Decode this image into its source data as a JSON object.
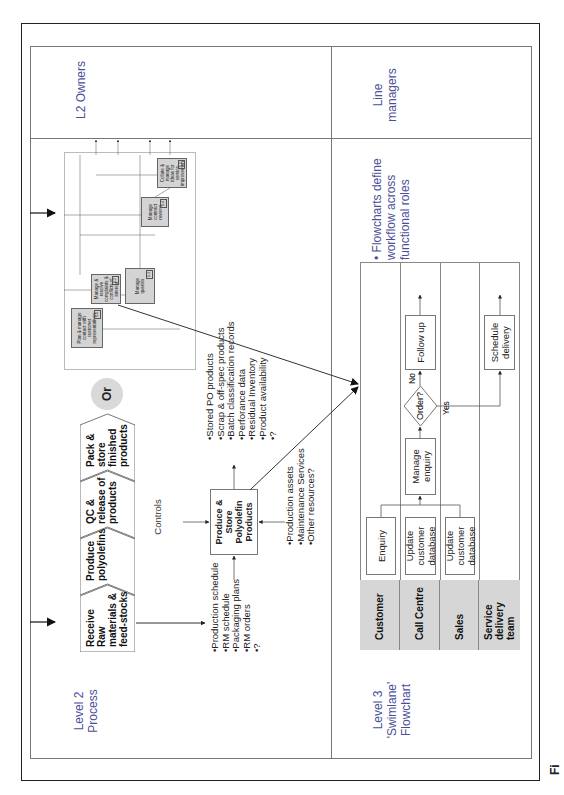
{
  "page": {
    "orientation": "rotated-90-ccw",
    "caption_fragment": "Fi"
  },
  "rows": {
    "top": {
      "left_label": "Level 2\nProcess",
      "right_label": "L2 Owners",
      "chevrons": [
        {
          "label": "Receive Raw materials & feed-stocks"
        },
        {
          "label": "Produce polyolefins"
        },
        {
          "label": "QC & release of products"
        },
        {
          "label": "Pack & store finished products"
        }
      ],
      "or_label": "Or",
      "idef": {
        "box_label": "Produce & Store Polyolefin Products",
        "controls_label": "Controls",
        "inputs": [
          "Production schedule",
          "RM schedule",
          "Packaging plans",
          "RM orders",
          "?"
        ],
        "outputs": [
          "Stored PO products",
          "Scrap & off-spec products",
          "Batch classification records",
          "Perforance data",
          "Residual Inventory",
          "Product availability",
          "?"
        ],
        "mechanisms": [
          "Production assets",
          "Maintenance Services",
          "Other resources?"
        ]
      },
      "mini_flow": {
        "boxes": [
          {
            "label": "Plan & manage contact with customer representatives",
            "num": "1.1"
          },
          {
            "label": "Manage & resolve complaints & conflicts of interest",
            "num": "1.2"
          },
          {
            "label": "Manage queries",
            "num": "1.3"
          },
          {
            "label": "Manage contract reviews",
            "num": "1.4"
          },
          {
            "label": "Collate & manage ideas for service improvement",
            "num": "1.5"
          }
        ]
      }
    },
    "bottom": {
      "left_label": "Level 3\n'Swimlane'\nFlowchart",
      "right_label": "Line\nmanagers",
      "bullet": "Flowcharts define workflow across functional roles",
      "swimlane": {
        "lanes": [
          "Customer",
          "Call Centre",
          "Sales",
          "Service delivery team"
        ],
        "steps": {
          "enquiry": "Enquiry",
          "update_cc": "Update customer database",
          "update_sales": "Update customer database",
          "manage_enquiry": "Manage enquiry",
          "decision": "Order?",
          "no": "No",
          "yes": "Yes",
          "follow_up": "Follow up",
          "schedule": "Schedule delivery"
        }
      }
    }
  },
  "colors": {
    "label_blue": "#4b4f98",
    "lane_grey": "#d6d6d6",
    "mini_box_grey": "#d4d4d4",
    "or_circle": "#d9d9d9"
  }
}
